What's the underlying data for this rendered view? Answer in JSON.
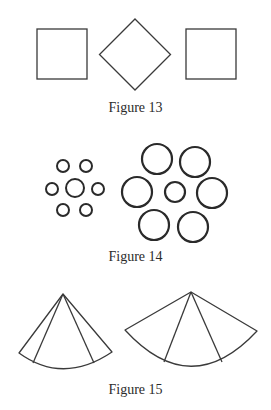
{
  "figures": [
    {
      "id": 13,
      "caption": "Figure 13",
      "shapes": [
        {
          "type": "square",
          "x": 37,
          "y": 29,
          "size": 50
        },
        {
          "type": "diamond",
          "cx": 135,
          "cy": 54.5,
          "half_diagonal": 35.5
        },
        {
          "type": "square",
          "x": 186,
          "y": 29,
          "size": 50
        }
      ]
    },
    {
      "id": 14,
      "caption": "Figure 14",
      "clusters": [
        {
          "name": "small-cluster",
          "center": {
            "cx": 75,
            "cy": 188,
            "r": 9
          },
          "ring": [
            {
              "cx": 63,
              "cy": 166,
              "r": 6
            },
            {
              "cx": 86,
              "cy": 166,
              "r": 6
            },
            {
              "cx": 52,
              "cy": 189,
              "r": 6
            },
            {
              "cx": 98,
              "cy": 189,
              "r": 6
            },
            {
              "cx": 63,
              "cy": 210,
              "r": 6
            },
            {
              "cx": 86,
              "cy": 210,
              "r": 6
            }
          ]
        },
        {
          "name": "large-cluster",
          "center": {
            "cx": 175,
            "cy": 192,
            "r": 10
          },
          "ring": [
            {
              "cx": 157,
              "cy": 159,
              "r": 15
            },
            {
              "cx": 195,
              "cy": 162,
              "r": 15
            },
            {
              "cx": 137,
              "cy": 192,
              "r": 15
            },
            {
              "cx": 212,
              "cy": 193,
              "r": 15
            },
            {
              "cx": 154,
              "cy": 225,
              "r": 15
            },
            {
              "cx": 193,
              "cy": 227,
              "r": 15
            }
          ]
        }
      ]
    },
    {
      "id": 15,
      "caption": "Figure 15",
      "sectors": [
        {
          "name": "narrow-sector",
          "apex": [
            63,
            294
          ],
          "left_end": [
            19,
            353
          ],
          "right_end": [
            112,
            352
          ],
          "arc_bottom": [
            63,
            370
          ],
          "inner_lines": [
            [
              33,
              363
            ],
            [
              94,
              363
            ]
          ]
        },
        {
          "name": "wide-sector",
          "apex": [
            191,
            292
          ],
          "left_end": [
            125,
            330
          ],
          "right_end": [
            257,
            331
          ],
          "arc_bottom": [
            191,
            367
          ],
          "inner_lines": [
            [
              164,
              362
            ],
            [
              222,
              362
            ]
          ]
        }
      ]
    }
  ],
  "style": {
    "stroke_color": "#3a3a3a",
    "circle_stroke_color": "#2a2a2a",
    "caption_color": "#2b2b2b"
  }
}
